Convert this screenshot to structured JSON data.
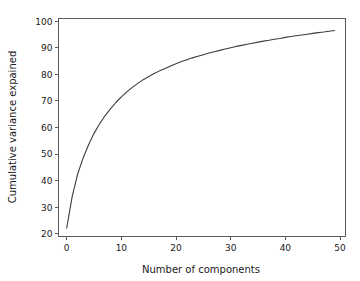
{
  "chart_data": {
    "type": "line",
    "title": "",
    "xlabel": "Number of components",
    "ylabel": "Cumulative variance expained",
    "xlim": [
      -1.5,
      51
    ],
    "ylim": [
      19,
      101
    ],
    "xticks": [
      0,
      10,
      20,
      30,
      40,
      50
    ],
    "xtick_labels": [
      "0",
      "10",
      "20",
      "30",
      "40",
      "50"
    ],
    "yticks": [
      20,
      30,
      40,
      50,
      60,
      70,
      80,
      90,
      100
    ],
    "ytick_labels": [
      "20",
      "30",
      "40",
      "50",
      "60",
      "70",
      "80",
      "90",
      "100"
    ],
    "grid": false,
    "legend": null,
    "line_color": "#3c3c3c",
    "background_color": "#ffffff",
    "series": [
      {
        "name": "Cumulative variance explained",
        "x": [
          0,
          1,
          2,
          3,
          4,
          5,
          6,
          7,
          8,
          9,
          10,
          11,
          12,
          13,
          14,
          15,
          16,
          17,
          18,
          19,
          20,
          21,
          22,
          23,
          24,
          25,
          26,
          27,
          28,
          29,
          30,
          31,
          32,
          33,
          34,
          35,
          36,
          37,
          38,
          39,
          40,
          41,
          42,
          43,
          44,
          45,
          46,
          47,
          48,
          49
        ],
        "y": [
          22.2,
          34.0,
          42.5,
          48.5,
          53.5,
          57.8,
          61.3,
          64.4,
          67.0,
          69.4,
          71.5,
          73.4,
          75.1,
          76.6,
          78.0,
          79.2,
          80.3,
          81.3,
          82.2,
          83.1,
          84.0,
          84.8,
          85.5,
          86.2,
          86.8,
          87.4,
          88.0,
          88.5,
          89.0,
          89.5,
          90.0,
          90.5,
          90.9,
          91.3,
          91.7,
          92.1,
          92.5,
          92.8,
          93.2,
          93.5,
          93.9,
          94.2,
          94.5,
          94.8,
          95.1,
          95.4,
          95.7,
          95.9,
          96.2,
          96.5
        ]
      }
    ]
  }
}
